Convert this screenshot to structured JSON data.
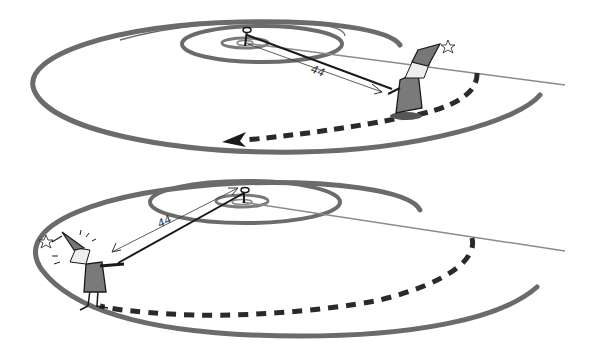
{
  "panels": [
    {
      "id": "top",
      "distance_label": "44",
      "description": "Wizard standing on outer spiral turn, measuring distance to center pin; dashed path continues counterclockwise with arrow"
    },
    {
      "id": "bottom",
      "distance_label": "44",
      "description": "Wizard moved further along spiral, measuring same distance to center pin; dashed path behind him"
    }
  ],
  "colors": {
    "spiral": "#6b6b6b",
    "line": "#8a8a8a",
    "ink": "#1a1a1a",
    "robe": "#7a7a7a",
    "background": "#ffffff"
  }
}
